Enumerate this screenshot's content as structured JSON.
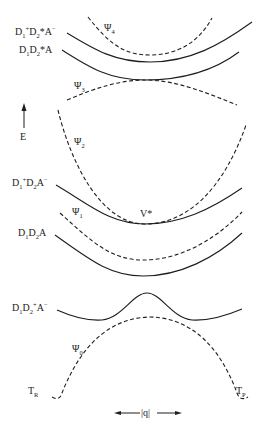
{
  "diagram": {
    "type": "potential-energy-curves",
    "axis": {
      "y_label": "E",
      "x_label": "|q|"
    },
    "diabatic_states": [
      {
        "id": "d1p_d2s_am",
        "base": "D",
        "label_parts": [
          "D",
          "1",
          "+",
          "D",
          "2",
          "*",
          "A",
          "−"
        ],
        "text": "D1+D2*A−",
        "style": "solid"
      },
      {
        "id": "d1_d2s_a",
        "text": "D1D2*A",
        "style": "solid"
      },
      {
        "id": "d1p_d2_am",
        "text": "D1+D2A−",
        "style": "solid"
      },
      {
        "id": "d1_d2_a",
        "text": "D1D2A",
        "style": "solid"
      },
      {
        "id": "d1_d2p_am",
        "text": "D1D2+A−",
        "style": "solid"
      }
    ],
    "adiabatic_states": [
      {
        "id": "psi4",
        "symbol": "Ψ",
        "sub": "4",
        "style": "dashed"
      },
      {
        "id": "psi3",
        "symbol": "Ψ",
        "sub": "3",
        "style": "dashed"
      },
      {
        "id": "psi2",
        "symbol": "Ψ",
        "sub": "2",
        "style": "dashed"
      },
      {
        "id": "psi1",
        "symbol": "Ψ",
        "sub": "1",
        "style": "dashed"
      },
      {
        "id": "psi0",
        "symbol": "Ψ",
        "sub": "0",
        "style": "dashed"
      }
    ],
    "annotations": {
      "v_star": "V*",
      "tr": {
        "base": "T",
        "sub": "R"
      },
      "tp": {
        "base": "T",
        "sub": "P"
      }
    },
    "labels": {
      "d1p_d2s_am": {
        "a": "D",
        "b": "1",
        "c": "+",
        "d": "D",
        "e": "2",
        "f": "*A",
        "g": "−"
      },
      "d1_d2s_a": {
        "a": "D",
        "b": "1",
        "c": "D",
        "d": "2",
        "e": "*A"
      },
      "d1p_d2_am": {
        "a": "D",
        "b": "1",
        "c": "+",
        "d": "D",
        "e": "2",
        "f": "A",
        "g": "−"
      },
      "d1_d2_a": {
        "a": "D",
        "b": "1",
        "c": "D",
        "d": "2",
        "e": "A"
      },
      "d1_d2p_am": {
        "a": "D",
        "b": "1",
        "c": "D",
        "d": "2",
        "e": "+",
        "f": "A",
        "g": "−"
      },
      "psi_symbol": "Ψ",
      "psi4_sub": "4",
      "psi3_sub": "3",
      "psi2_sub": "2",
      "psi1_sub": "1",
      "psi0_sub": "0",
      "e": "E",
      "q": "|q|",
      "v_star": "V*",
      "t": "T",
      "r": "R",
      "p": "P"
    },
    "colors": {
      "line": "#1e1e1e",
      "background": "#ffffff"
    }
  }
}
